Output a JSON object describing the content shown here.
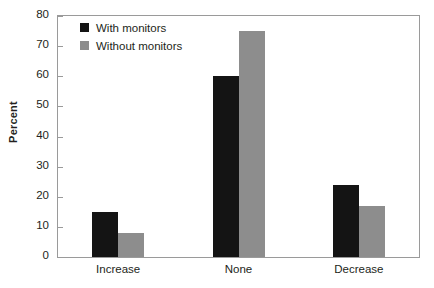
{
  "chart_data": {
    "type": "bar",
    "title": "",
    "xlabel": "",
    "ylabel": "Percent",
    "categories": [
      "Increase",
      "None",
      "Decrease"
    ],
    "series": [
      {
        "name": "With monitors",
        "color": "#141414",
        "values": [
          15,
          60,
          24
        ]
      },
      {
        "name": "Without monitors",
        "color": "#8d8d8d",
        "values": [
          8,
          75,
          17
        ]
      }
    ],
    "ylim": [
      0,
      80
    ],
    "yticks": [
      0,
      10,
      20,
      30,
      40,
      50,
      60,
      70,
      80
    ],
    "ytick_labels": [
      "0",
      "10",
      "20",
      "30",
      "40",
      "50",
      "60",
      "70",
      "80"
    ],
    "grid": false,
    "legend_position": "top-left"
  }
}
